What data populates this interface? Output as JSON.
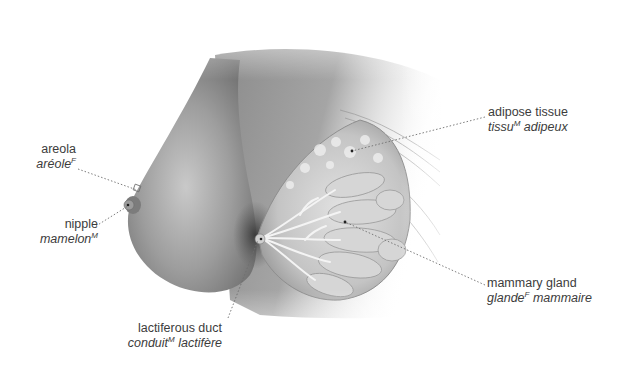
{
  "figure": {
    "labels": {
      "areola": {
        "en": "areola",
        "fr_word": "aréole",
        "fr_gender": "F",
        "fr_rest": ""
      },
      "nipple": {
        "en": "nipple",
        "fr_word": "mamelon",
        "fr_gender": "M",
        "fr_rest": ""
      },
      "adipose_tissue": {
        "en": "adipose tissue",
        "fr_word": "tissu",
        "fr_gender": "M",
        "fr_rest": " adipeux"
      },
      "mammary_gland": {
        "en": "mammary gland",
        "fr_word": "glande",
        "fr_gender": "F",
        "fr_rest": " mammaire"
      },
      "lactiferous_duct": {
        "en": "lactiferous duct",
        "fr_word": "conduit",
        "fr_gender": "M",
        "fr_rest": " lactifère"
      }
    },
    "colors": {
      "label_text": "#3c3c3c",
      "leader_line": "#6e6e6e",
      "skin_mid": "#8f8f8f",
      "skin_dark": "#5a5a5a",
      "gland_light": "#d8d8d8"
    }
  }
}
